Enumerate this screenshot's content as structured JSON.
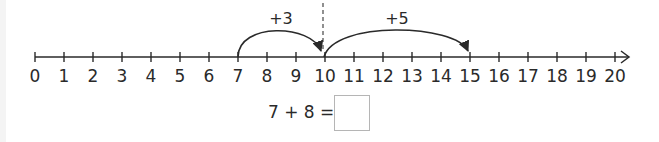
{
  "number_line": {
    "start": 0,
    "end": 20,
    "step": 1,
    "labels": [
      "0",
      "1",
      "2",
      "3",
      "4",
      "5",
      "6",
      "7",
      "8",
      "9",
      "10",
      "11",
      "12",
      "13",
      "14",
      "15",
      "16",
      "17",
      "18",
      "19",
      "20"
    ],
    "marker": {
      "position": 10,
      "style": "dashed"
    },
    "jumps": [
      {
        "from": 7,
        "to": 10,
        "label": "+3"
      },
      {
        "from": 10,
        "to": 15,
        "label": "+5"
      }
    ]
  },
  "equation": {
    "text": "7 + 8 =",
    "answer": ""
  },
  "colors": {
    "ink": "#2a2a2a",
    "box_border": "#b5b5b5",
    "background": "#ffffff"
  }
}
